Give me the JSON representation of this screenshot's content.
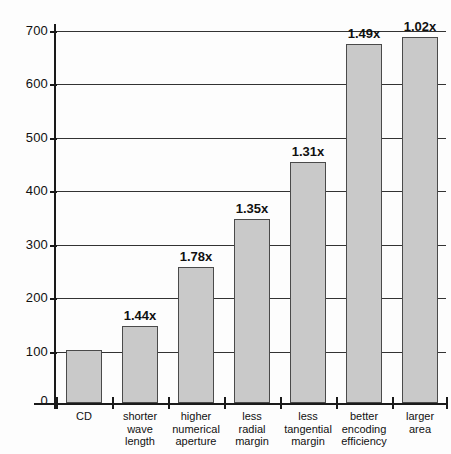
{
  "chart_data": {
    "type": "bar",
    "title": "",
    "subtitle": "",
    "xlabel": "",
    "ylabel": "",
    "ylim": [
      0,
      700
    ],
    "yticks": [
      0,
      100,
      200,
      300,
      400,
      500,
      600,
      700
    ],
    "ytick_labels": [
      "0",
      "100",
      "200",
      "300",
      "400",
      "500",
      "600",
      "700"
    ],
    "grid": true,
    "legend": "none",
    "categories": [
      "CD",
      "shorter\nwave\nlength",
      "higher\nnumerical\naperture",
      "less\nradial\nmargin",
      "less\ntangential\nmargin",
      "better\nencoding\nefficiency",
      "larger\narea"
    ],
    "values": [
      100,
      144,
      256,
      346,
      453,
      675,
      689
    ],
    "data_labels": [
      "",
      "1.44x",
      "1.78x",
      "1.35x",
      "1.31x",
      "1.49x",
      "1.02x"
    ],
    "bar_fill_color": "#c9c9c9",
    "bar_edge_color": "#4a4a4a",
    "axis_color": "#1a1a1a",
    "grid_color": "#333333",
    "background_color": "#fdfdfd"
  }
}
